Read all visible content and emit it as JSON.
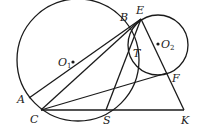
{
  "figure": {
    "type": "geometry-diagram",
    "circles": [
      {
        "name": "O1",
        "cx": 78,
        "cy": 60,
        "r": 61
      },
      {
        "name": "O2",
        "cx": 158,
        "cy": 45,
        "r": 30
      }
    ],
    "points": {
      "A": [
        29,
        98
      ],
      "C": [
        41,
        110
      ],
      "B": [
        125,
        24
      ],
      "E": [
        141,
        19
      ],
      "T": [
        131,
        49
      ],
      "F": [
        167,
        73
      ],
      "S": [
        106,
        110
      ],
      "K": [
        184,
        110
      ],
      "O1": [
        73,
        62
      ],
      "O2": [
        158,
        44
      ]
    },
    "segments": [
      [
        "A",
        "E"
      ],
      [
        "C",
        "E"
      ],
      [
        "S",
        "E"
      ],
      [
        "C",
        "F"
      ],
      [
        "C",
        "K"
      ],
      [
        "E",
        "K"
      ]
    ],
    "labels": {
      "A": "A",
      "B": "B",
      "C": "C",
      "E": "E",
      "T": "T",
      "F": "F",
      "S": "S",
      "K": "K",
      "O": "O",
      "sub1": "1",
      "sub2": "2"
    }
  }
}
